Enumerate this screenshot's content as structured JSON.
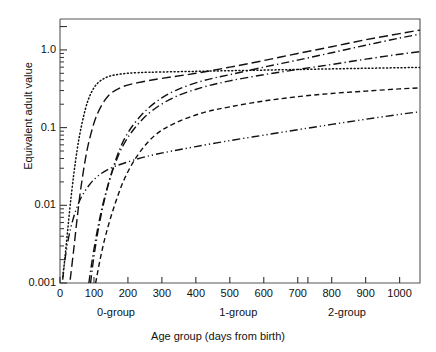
{
  "chart_data": {
    "type": "line",
    "title": "",
    "xlabel": "Age group (days from birth)",
    "ylabel": "Equivalent adult value",
    "xlim": [
      0,
      1060
    ],
    "ylim": [
      0.001,
      2.5
    ],
    "yscale": "log",
    "grid": false,
    "legend": "none",
    "x_ticks": [
      0,
      100,
      200,
      300,
      400,
      500,
      600,
      700,
      800,
      900,
      1000
    ],
    "x_tick_labels": [
      "0",
      "100",
      "200",
      "300",
      "400",
      "500",
      "600",
      "700",
      "800",
      "900",
      "1000"
    ],
    "y_ticks": [
      0.001,
      0.01,
      0.1,
      1.0
    ],
    "y_tick_labels": [
      "0.001",
      "0.01",
      "0.1",
      "1.0"
    ],
    "x_group_annotations": [
      {
        "label": "0-group",
        "x": 165
      },
      {
        "label": "1-group",
        "x": 525
      },
      {
        "label": "2-group",
        "x": 845
      }
    ],
    "series": [
      {
        "name": "series-1-dotted",
        "style": "dotted",
        "x": [
          8,
          15,
          22,
          30,
          40,
          50,
          60,
          75,
          90,
          110,
          140,
          180,
          230,
          300,
          400,
          500,
          600,
          700,
          800,
          900,
          1000,
          1060
        ],
        "y": [
          0.0012,
          0.0022,
          0.0045,
          0.01,
          0.024,
          0.05,
          0.09,
          0.175,
          0.27,
          0.37,
          0.45,
          0.49,
          0.51,
          0.52,
          0.53,
          0.54,
          0.55,
          0.56,
          0.57,
          0.58,
          0.59,
          0.595
        ]
      },
      {
        "name": "series-2-long-dash",
        "style": "long-dash",
        "x": [
          30,
          40,
          50,
          60,
          75,
          90,
          110,
          140,
          180,
          230,
          300,
          400,
          500,
          600,
          700,
          800,
          900,
          1000,
          1060
        ],
        "y": [
          0.0011,
          0.0026,
          0.0065,
          0.015,
          0.04,
          0.08,
          0.15,
          0.25,
          0.33,
          0.38,
          0.43,
          0.5,
          0.6,
          0.73,
          0.9,
          1.1,
          1.35,
          1.62,
          1.8
        ]
      },
      {
        "name": "series-3-dash-dot",
        "style": "dash-dot",
        "x": [
          90,
          100,
          115,
          135,
          160,
          190,
          230,
          280,
          340,
          420,
          500,
          600,
          700,
          800,
          900,
          1000,
          1060
        ],
        "y": [
          0.001,
          0.0022,
          0.0055,
          0.014,
          0.034,
          0.072,
          0.13,
          0.21,
          0.3,
          0.4,
          0.48,
          0.6,
          0.74,
          0.92,
          1.15,
          1.42,
          1.6
        ]
      },
      {
        "name": "series-4-dash-dot-lower",
        "style": "dash-dot",
        "x": [
          85,
          95,
          110,
          130,
          155,
          185,
          225,
          275,
          340,
          420,
          500,
          600,
          700,
          800,
          900,
          1000,
          1060
        ],
        "y": [
          0.001,
          0.002,
          0.0048,
          0.012,
          0.028,
          0.058,
          0.105,
          0.17,
          0.25,
          0.33,
          0.4,
          0.48,
          0.56,
          0.65,
          0.76,
          0.88,
          0.95
        ]
      },
      {
        "name": "series-5-short-dash",
        "style": "short-dash",
        "x": [
          105,
          118,
          135,
          160,
          190,
          230,
          280,
          340,
          420,
          500,
          600,
          700,
          800,
          900,
          1000,
          1060
        ],
        "y": [
          0.001,
          0.002,
          0.0042,
          0.0098,
          0.022,
          0.045,
          0.08,
          0.115,
          0.155,
          0.185,
          0.22,
          0.25,
          0.275,
          0.295,
          0.315,
          0.325
        ]
      },
      {
        "name": "series-6-dash-dot-dot",
        "style": "dash-dot-dot",
        "x": [
          8,
          14,
          22,
          32,
          45,
          62,
          85,
          110,
          145,
          190,
          250,
          320,
          400,
          500,
          600,
          700,
          800,
          900,
          1000,
          1060
        ],
        "y": [
          0.0011,
          0.0019,
          0.0032,
          0.0052,
          0.0082,
          0.0125,
          0.018,
          0.0235,
          0.0295,
          0.035,
          0.042,
          0.049,
          0.057,
          0.068,
          0.08,
          0.094,
          0.11,
          0.128,
          0.148,
          0.16
        ]
      }
    ]
  }
}
